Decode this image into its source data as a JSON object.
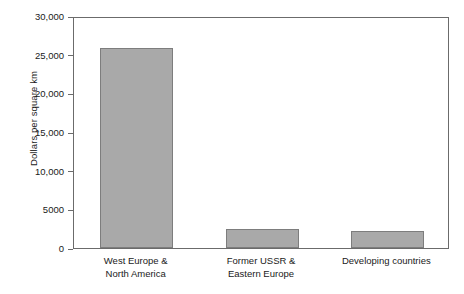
{
  "chart_data": {
    "type": "bar",
    "title": "",
    "xlabel": "",
    "ylabel": "Dollars per square km",
    "categories": [
      "West Europe & North America",
      "Former USSR & Eastern Europe",
      "Developing countries"
    ],
    "category_lines": [
      [
        "West Europe &",
        "North America"
      ],
      [
        "Former USSR &",
        "Eastern Europe"
      ],
      [
        "Developing countries"
      ]
    ],
    "values": [
      25900,
      2450,
      2200
    ],
    "ylim": [
      0,
      30000
    ],
    "ytick_values": [
      0,
      5000,
      10000,
      15000,
      20000,
      25000,
      30000
    ],
    "ytick_labels": [
      "0",
      "5000",
      "10,000",
      "15,000",
      "20,000",
      "25,000",
      "30,000"
    ],
    "grid": false,
    "legend": "none",
    "bar_color": "#a9a9a9",
    "bar_border_color": "#7d7d7d",
    "axis_color": "#6b6b6b",
    "background_color": "#ffffff"
  }
}
